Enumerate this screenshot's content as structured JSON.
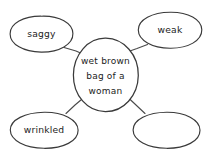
{
  "diagram": {
    "type": "concept-map",
    "title": "wet brown bag of a woman",
    "background_color": "#ffffff",
    "ink_color": "#3a3a3a",
    "text_color": "#1c1c1c",
    "center": {
      "id": "center-bubble",
      "lines": [
        "wet brown",
        "bag of a",
        "woman"
      ],
      "cx": 105.5,
      "cy": 75,
      "rx": 33,
      "ry": 37
    },
    "nodes": [
      {
        "id": "bubble-saggy",
        "label": "saggy",
        "position": "top-left",
        "cx": 41.5,
        "cy": 34,
        "rx": 31.5,
        "ry": 18
      },
      {
        "id": "bubble-weak",
        "label": "weak",
        "position": "top-right",
        "cx": 170,
        "cy": 30,
        "rx": 32,
        "ry": 18
      },
      {
        "id": "bubble-wrinkled",
        "label": "wrinkled",
        "position": "bottom-left",
        "cx": 44,
        "cy": 130,
        "rx": 34,
        "ry": 18
      },
      {
        "id": "bubble-empty",
        "label": "",
        "position": "bottom-right",
        "cx": 166.5,
        "cy": 130,
        "rx": 33.5,
        "ry": 18
      }
    ],
    "connectors": [
      {
        "id": "connector-saggy",
        "from": "center-bubble",
        "to": "bubble-saggy",
        "x1": 84,
        "y1": 54,
        "x2": 64,
        "y2": 48
      },
      {
        "id": "connector-weak",
        "from": "center-bubble",
        "to": "bubble-weak",
        "x1": 128,
        "y1": 52,
        "x2": 147,
        "y2": 45
      },
      {
        "id": "connector-wrinkled",
        "from": "center-bubble",
        "to": "bubble-wrinkled",
        "x1": 84,
        "y1": 98,
        "x2": 66,
        "y2": 114
      },
      {
        "id": "connector-empty",
        "from": "center-bubble",
        "to": "bubble-empty",
        "x1": 128,
        "y1": 98,
        "x2": 145,
        "y2": 114
      }
    ]
  }
}
